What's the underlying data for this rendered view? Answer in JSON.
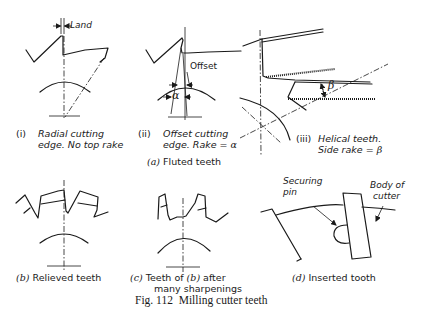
{
  "figure": {
    "number_label": "Fig. 112",
    "title": "Milling cutter teeth"
  },
  "group_a": {
    "letter": "(a)",
    "caption": "Fluted teeth",
    "panels": [
      {
        "id": "i",
        "numeral": "(i)",
        "line1": "Radial cutting",
        "line2": "edge. No top rake",
        "annotations": [
          "Land"
        ]
      },
      {
        "id": "ii",
        "numeral": "(ii)",
        "line1": "Offset cutting",
        "line2_prefix": "edge. Rake = ",
        "line2_symbol": "α",
        "annotations": [
          "Offset",
          "α"
        ]
      },
      {
        "id": "iii",
        "numeral": "(iii)",
        "line1": "Helical teeth.",
        "line2_prefix": "Side rake = ",
        "line2_symbol": "β",
        "annotations": [
          "β"
        ]
      }
    ]
  },
  "group_b": {
    "letter": "(b)",
    "caption": "Relieved teeth"
  },
  "group_c": {
    "letter": "(c)",
    "caption_prefix": "Teeth of ",
    "caption_ref": "(b)",
    "caption_suffix": " after",
    "caption_line2": "many sharpenings"
  },
  "group_d": {
    "letter": "(d)",
    "caption": "Inserted tooth",
    "annotations": {
      "pin_line1": "Securing",
      "pin_line2": "pin",
      "body_line1": "Body of",
      "body_line2": "cutter"
    }
  }
}
